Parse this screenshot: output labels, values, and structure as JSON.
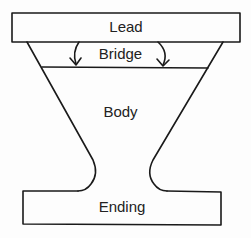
{
  "diagram": {
    "type": "inverted-pyramid-structure",
    "sections": [
      {
        "id": "lead",
        "label": "Lead"
      },
      {
        "id": "bridge",
        "label": "Bridge"
      },
      {
        "id": "body",
        "label": "Body"
      },
      {
        "id": "ending",
        "label": "Ending"
      }
    ],
    "arrows": [
      {
        "from": "lead",
        "to": "bridge",
        "side": "left"
      },
      {
        "from": "lead",
        "to": "bridge",
        "side": "right"
      }
    ],
    "colors": {
      "line": "#1a1a1a",
      "background": "#fdfdfd"
    }
  }
}
